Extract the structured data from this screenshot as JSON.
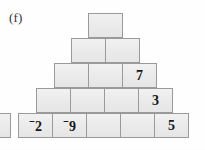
{
  "figure": {
    "part_label": "(f)",
    "type": "number-pyramid",
    "row_count": 5,
    "block_width_px": 35,
    "block_height_px": 25,
    "fill_color": "#ececec",
    "border_color": "#9a9a9a",
    "background_color": "#fefefe",
    "text_color": "#16181a"
  },
  "pyramid": {
    "rows": [
      {
        "index": 1,
        "name": "pyramid-row-1",
        "left_px": 88,
        "top_px": 13,
        "cells": [
          {
            "name": "cell-r1-c1",
            "value": "",
            "empty": true,
            "negative": false
          }
        ]
      },
      {
        "index": 2,
        "name": "pyramid-row-2",
        "left_px": 71,
        "top_px": 38,
        "cells": [
          {
            "name": "cell-r2-c1",
            "value": "",
            "empty": true,
            "negative": false
          },
          {
            "name": "cell-r2-c2",
            "value": "",
            "empty": true,
            "negative": false
          }
        ]
      },
      {
        "index": 3,
        "name": "pyramid-row-3",
        "left_px": 54,
        "top_px": 63,
        "cells": [
          {
            "name": "cell-r3-c1",
            "value": "",
            "empty": true,
            "negative": false
          },
          {
            "name": "cell-r3-c2",
            "value": "",
            "empty": true,
            "negative": false
          },
          {
            "name": "cell-r3-c3",
            "value": "7",
            "empty": false,
            "negative": false
          }
        ]
      },
      {
        "index": 4,
        "name": "pyramid-row-4",
        "left_px": 36,
        "top_px": 88,
        "cells": [
          {
            "name": "cell-r4-c1",
            "value": "",
            "empty": true,
            "negative": false
          },
          {
            "name": "cell-r4-c2",
            "value": "",
            "empty": true,
            "negative": false
          },
          {
            "name": "cell-r4-c3",
            "value": "",
            "empty": true,
            "negative": false
          },
          {
            "name": "cell-r4-c4",
            "value": "3",
            "empty": false,
            "negative": false
          }
        ]
      },
      {
        "index": 5,
        "name": "pyramid-row-5",
        "left_px": 18,
        "top_px": 113,
        "cells": [
          {
            "name": "cell-r5-c1",
            "value": "2",
            "empty": false,
            "negative": true
          },
          {
            "name": "cell-r5-c2",
            "value": "9",
            "empty": false,
            "negative": true
          },
          {
            "name": "cell-r5-c3",
            "value": "",
            "empty": true,
            "negative": false
          },
          {
            "name": "cell-r5-c4",
            "value": "",
            "empty": true,
            "negative": false
          },
          {
            "name": "cell-r5-c5",
            "value": "5",
            "empty": false,
            "negative": false
          }
        ]
      }
    ],
    "negative_sign_glyph": "⁻",
    "filled_values": [
      "7",
      "3",
      "⁻2",
      "⁻9",
      "5"
    ]
  },
  "left_bleed_box": {
    "name": "adjacent-figure-partial-box",
    "visible": true,
    "value": ""
  }
}
